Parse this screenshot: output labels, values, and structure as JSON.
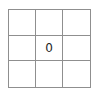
{
  "board": {
    "rows": 3,
    "cols": 3,
    "line_color": "#8f8f8f",
    "background_color": "#ffffff",
    "text_color": "#1f1f1f",
    "cells": [
      [
        "",
        "",
        ""
      ],
      [
        "",
        "0",
        ""
      ],
      [
        "",
        "",
        ""
      ]
    ]
  }
}
